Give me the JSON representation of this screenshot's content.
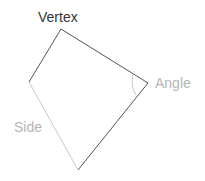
{
  "diagram": {
    "labels": {
      "vertex": "Vertex",
      "angle": "Angle",
      "side": "Side"
    },
    "colors": {
      "edge": "#555555",
      "highlight_side": "#c8c8c8",
      "vertex_label": "#333333",
      "muted_label": "#b5b5b5"
    },
    "vertices": [
      {
        "name": "top",
        "x": 61,
        "y": 29
      },
      {
        "name": "right",
        "x": 148,
        "y": 83
      },
      {
        "name": "bottom",
        "x": 78,
        "y": 170
      },
      {
        "name": "left",
        "x": 29,
        "y": 82
      }
    ]
  }
}
